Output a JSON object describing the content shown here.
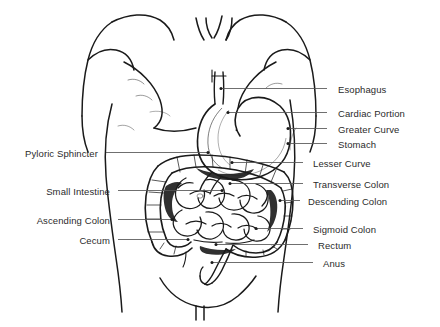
{
  "diagram": {
    "type": "anatomical-line-drawing",
    "background_color": "#ffffff",
    "line_color": "#1a1a1a",
    "text_color": "#2b2b2b",
    "leader_line_color": "#555555"
  },
  "labels_right": [
    {
      "id": "esophagus",
      "text": "Esophagus",
      "x": 338,
      "y": 84,
      "leader_x1": 327,
      "leader_x2": 221,
      "leader_y": 88.5
    },
    {
      "id": "cardiac-portion",
      "text": "Cardiac Portion",
      "x": 338,
      "y": 108,
      "leader_x1": 327,
      "leader_x2": 228,
      "leader_y": 112.5
    },
    {
      "id": "greater-curve",
      "text": "Greater Curve",
      "x": 338,
      "y": 124,
      "leader_x1": 327,
      "leader_x2": 288,
      "leader_y": 128.5
    },
    {
      "id": "stomach",
      "text": "Stomach",
      "x": 338,
      "y": 139,
      "leader_x1": 327,
      "leader_x2": 288,
      "leader_y": 143.5
    },
    {
      "id": "lesser-curve",
      "text": "Lesser Curve",
      "x": 313,
      "y": 158,
      "leader_x1": 303,
      "leader_x2": 232,
      "leader_y": 162.5
    },
    {
      "id": "transverse-colon",
      "text": "Transverse Colon",
      "x": 313,
      "y": 179,
      "leader_x1": 303,
      "leader_x2": 230,
      "leader_y": 183.5
    },
    {
      "id": "descending-colon",
      "text": "Descending Colon",
      "x": 308,
      "y": 196,
      "leader_x1": 300,
      "leader_x2": 280,
      "leader_y": 200.5
    },
    {
      "id": "sigmoid-colon",
      "text": "Sigmoid Colon",
      "x": 313,
      "y": 224,
      "leader_x1": 303,
      "leader_x2": 256,
      "leader_y": 228.5
    },
    {
      "id": "rectum",
      "text": "Rectum",
      "x": 318,
      "y": 240,
      "leader_x1": 308,
      "leader_x2": 216,
      "leader_y": 244.5
    },
    {
      "id": "anus",
      "text": "Anus",
      "x": 323,
      "y": 258,
      "leader_x1": 313,
      "leader_x2": 212,
      "leader_y": 262.5
    }
  ],
  "labels_left": [
    {
      "id": "pyloric-sphincter",
      "text": "Pyloric Sphincter",
      "x": 98,
      "y": 148,
      "leader_x1": 106,
      "leader_x2": 208,
      "leader_y": 152.5
    },
    {
      "id": "small-intestine",
      "text": "Small Intestine",
      "x": 110,
      "y": 186,
      "leader_x1": 118,
      "leader_x2": 222,
      "leader_y": 190.5
    },
    {
      "id": "ascending-colon",
      "text": "Ascending Colon",
      "x": 110,
      "y": 215,
      "leader_x1": 118,
      "leader_x2": 172,
      "leader_y": 219.5
    },
    {
      "id": "cecum",
      "text": "Cecum",
      "x": 110,
      "y": 235,
      "leader_x1": 118,
      "leader_x2": 188,
      "leader_y": 239.5
    }
  ]
}
